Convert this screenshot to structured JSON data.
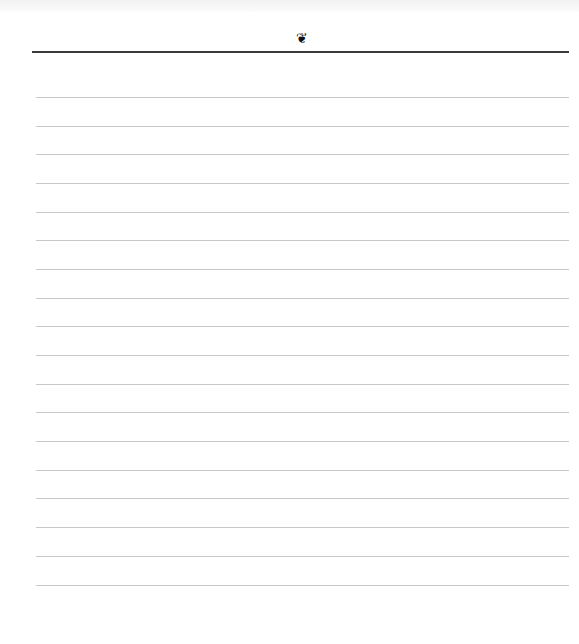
{
  "page": {
    "type": "lined-notepaper",
    "background_color": "#ffffff",
    "header": {
      "ornament_icon": "fleuron-heart-icon",
      "ornament_glyph": "❦",
      "rule_color": "#3a3a3a"
    },
    "lines": {
      "count": 18,
      "color": "#c8c8c8"
    }
  }
}
